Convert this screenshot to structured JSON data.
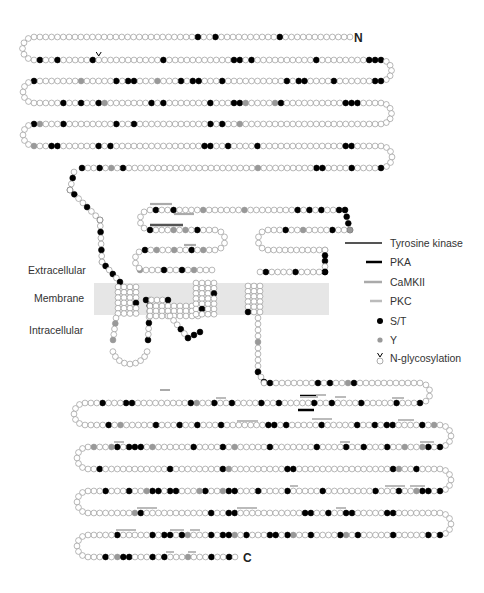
{
  "labels": {
    "n_terminus": "N",
    "c_terminus": "C",
    "extracellular": "Extracellular",
    "membrane": "Membrane",
    "intracellular": "Intracellular"
  },
  "legend": [
    {
      "key": "tyrosine_kinase",
      "label": "Tyrosine kinase",
      "symbol": "line",
      "color": "#555555"
    },
    {
      "key": "pka",
      "label": "PKA",
      "symbol": "line",
      "color": "#000000"
    },
    {
      "key": "camkii",
      "label": "CaMKII",
      "symbol": "line",
      "color": "#aaaaaa"
    },
    {
      "key": "pkc",
      "label": "PKC",
      "symbol": "line",
      "color": "#bbbbbb"
    },
    {
      "key": "st",
      "label": "S/T",
      "symbol": "dot",
      "color": "#000000"
    },
    {
      "key": "y",
      "label": "Y",
      "symbol": "dot",
      "color": "#999999"
    },
    {
      "key": "nglyc",
      "label": "N-glycosylation",
      "symbol": "glyc",
      "color": "#000000"
    }
  ],
  "colors": {
    "st": "#000000",
    "y": "#999999",
    "open": "#ffffff",
    "outline": "#888888",
    "membrane": "#e6e6e6"
  },
  "residue_rows": [
    "oooooooooooobooooooooooboobooooooooooooooooooooooooooooooooogoooo",
    "oboobooooobvoooooooooobooooooooooobbobooooooooooboooooooobbboooooob",
    "bbooooooboooobboboooooooooobooobbobooogooobbobooooogooooooob",
    "ooooobooboobgooooooobobooooooobooobbgoooogboooooooooobbb",
    "oooooooooooooooooooooooogooboboooooooooooobooboooooooobooogbooob",
    "goobboooooobobooooooooooooooobboobooooboooooooooooooobbooooooooo",
    "booooboooobbooooooooogoooooooooooooooooooooobogobooboobooo"
  ],
  "sites": {
    "st_count_label": "S/T",
    "y_count_label": "Y"
  }
}
